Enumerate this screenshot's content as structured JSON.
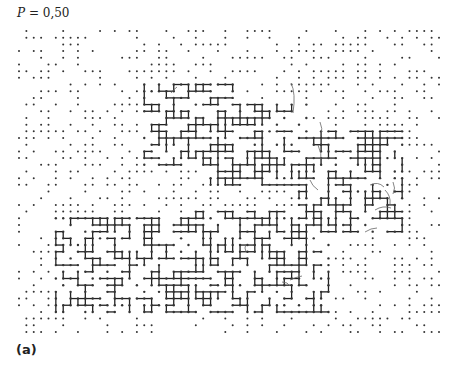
{
  "figure": {
    "title_var": "P",
    "title_rest": " = 0,50",
    "panel_label": "(a)"
  },
  "lattice": {
    "occupation_probability": 0.5,
    "columns": 58,
    "rows": 46,
    "colors": {
      "site": "#333333",
      "bond": "#222222",
      "annotation": "#666666"
    }
  }
}
